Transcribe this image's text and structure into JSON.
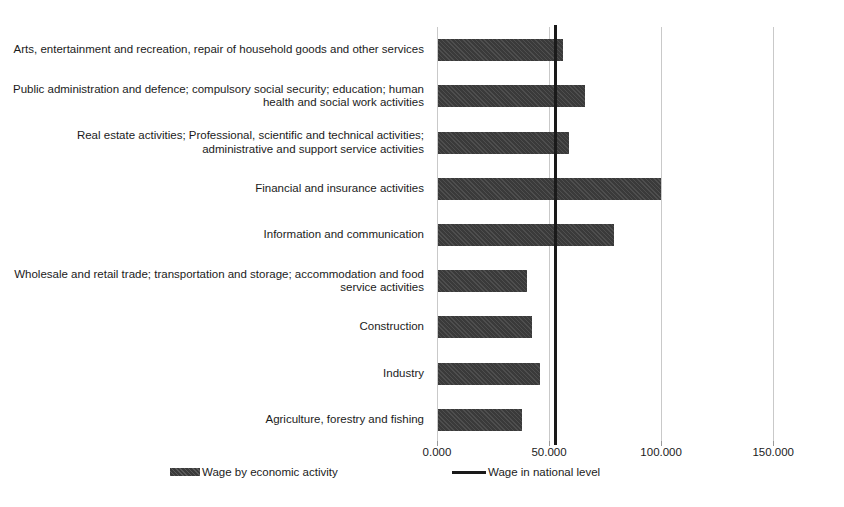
{
  "chart_data": {
    "type": "bar",
    "orientation": "horizontal",
    "title": "",
    "xlabel": "",
    "ylabel": "",
    "xlim": [
      0,
      157.5
    ],
    "grid": true,
    "legend_position": "bottom",
    "categories": [
      "Agriculture, forestry and fishing",
      "Industry",
      "Construction",
      "Wholesale and retail trade;  transportation and storage; accommodation and food service activities",
      "Information and communication",
      "Financial and insurance activities",
      "Real estate activities; Professional, scientific and technical activities; administrative and support service activities",
      "Public administration and defence; compulsory social security; education; human health and social work activities",
      "Arts, entertainment and recreation, repair of household goods and other services"
    ],
    "series": [
      {
        "name": "Wage by economic activity",
        "type": "bar",
        "color": "#3a3a3a",
        "values": [
          38.0,
          46.0,
          42.5,
          40.0,
          79.0,
          100.0,
          59.0,
          66.0,
          56.0
        ]
      },
      {
        "name": "Wage in national level",
        "type": "reference-line",
        "color": "#1a1a1a",
        "value": 52.5
      }
    ],
    "xticks": [
      {
        "value": 0,
        "label": "0.000"
      },
      {
        "value": 50,
        "label": "50.000"
      },
      {
        "value": 100,
        "label": "100.000"
      },
      {
        "value": 150,
        "label": "150.000"
      }
    ]
  },
  "legend": {
    "bar_label": "Wage by economic activity",
    "line_label": "Wage in national level"
  },
  "colors": {
    "bar": "#3a3a3a",
    "reference_line": "#1a1a1a",
    "gridline": "#c9c9c9",
    "text": "#1b1b1b",
    "background": "#ffffff"
  }
}
